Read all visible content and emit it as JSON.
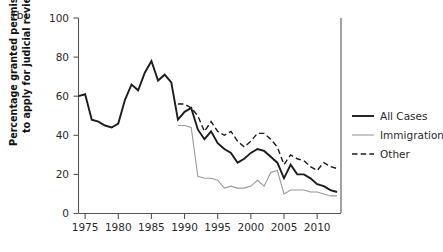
{
  "panel": {
    "label": "(b)"
  },
  "axes": {
    "ylabel_line1": "Percentage granted permission",
    "ylabel_line2": "to apply for judicial review",
    "ylabel": "Percentage granted permission to apply for judicial review",
    "xlabel": ""
  },
  "legend": {
    "position": "right",
    "entries": [
      {
        "label": "All Cases",
        "style": "solid-thick",
        "color": "#1c1c1c"
      },
      {
        "label": "Immigration",
        "style": "solid-thin",
        "color": "#9a9a9a"
      },
      {
        "label": "Other",
        "style": "dashed",
        "color": "#1c1c1c"
      }
    ]
  },
  "chart_data": {
    "type": "line",
    "title": "",
    "subtitle": "",
    "xlabel": "",
    "ylabel": "Percentage granted permission to apply for judicial review",
    "xlim": [
      1974,
      2013.6
    ],
    "ylim": [
      0,
      100
    ],
    "yticks": [
      0,
      20,
      40,
      60,
      80,
      100
    ],
    "xticks": [
      1975,
      1980,
      1985,
      1990,
      1995,
      2000,
      2005,
      2010
    ],
    "ytick_labels": [
      "0",
      "20",
      "40",
      "60",
      "80",
      "100"
    ],
    "xtick_labels": [
      "1975",
      "1980",
      "1985",
      "1990",
      "1995",
      "2000",
      "2005",
      "2010"
    ],
    "grid": false,
    "legend_position": "right",
    "series": [
      {
        "name": "All Cases",
        "color": "#1c1c1c",
        "style": "solid-thick",
        "x": [
          1974,
          1975,
          1976,
          1977,
          1978,
          1979,
          1980,
          1981,
          1982,
          1983,
          1984,
          1985,
          1986,
          1987,
          1988,
          1989,
          1990,
          1991,
          1992,
          1993,
          1994,
          1995,
          1996,
          1997,
          1998,
          1999,
          2000,
          2001,
          2002,
          2003,
          2004,
          2005,
          2006,
          2007,
          2008,
          2009,
          2010,
          2011,
          2012,
          2013
        ],
        "values": [
          60,
          61,
          48,
          47,
          45,
          44,
          46,
          58,
          66,
          63,
          72,
          78,
          68,
          71,
          67,
          48,
          52,
          54,
          43,
          38,
          42,
          36,
          33,
          31,
          26,
          28,
          31,
          33,
          32,
          29,
          26,
          18,
          25,
          20,
          20,
          18,
          15,
          14,
          12,
          11
        ]
      },
      {
        "name": "Immigration",
        "color": "#9a9a9a",
        "style": "solid-thin",
        "x": [
          1989,
          1990,
          1991,
          1992,
          1993,
          1994,
          1995,
          1996,
          1997,
          1998,
          1999,
          2000,
          2001,
          2002,
          2003,
          2004,
          2005,
          2006,
          2007,
          2008,
          2009,
          2010,
          2011,
          2012,
          2013
        ],
        "values": [
          45,
          45,
          44,
          19,
          18,
          18,
          17,
          13,
          14,
          13,
          13,
          14,
          17,
          14,
          21,
          22,
          10,
          12,
          12,
          12,
          11,
          11,
          10,
          9,
          9
        ]
      },
      {
        "name": "Other",
        "color": "#1c1c1c",
        "style": "dashed",
        "x": [
          1989,
          1990,
          1991,
          1992,
          1993,
          1994,
          1995,
          1996,
          1997,
          1998,
          1999,
          2000,
          2001,
          2002,
          2003,
          2004,
          2005,
          2006,
          2007,
          2008,
          2009,
          2010,
          2011,
          2012,
          2013
        ],
        "values": [
          56,
          56,
          54,
          50,
          42,
          47,
          42,
          40,
          42,
          37,
          34,
          37,
          41,
          41,
          38,
          34,
          25,
          30,
          28,
          27,
          24,
          22,
          26,
          24,
          23
        ]
      }
    ]
  }
}
